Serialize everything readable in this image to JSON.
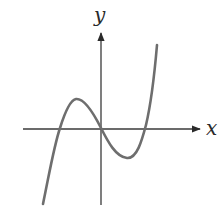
{
  "diagram": {
    "title": "",
    "type": "cubic function graph",
    "x_axis_label": "x",
    "y_axis_label": "y",
    "colors": {
      "axes": "#3a3a3a",
      "curve": "#6e6e6e",
      "background": "#ffffff"
    },
    "curve_description": "Cubic curve rising from lower-left, local maximum left of the y-axis, passing through the origin, local minimum right of the y-axis, then rising steeply to upper-right; crosses x-axis three times"
  }
}
